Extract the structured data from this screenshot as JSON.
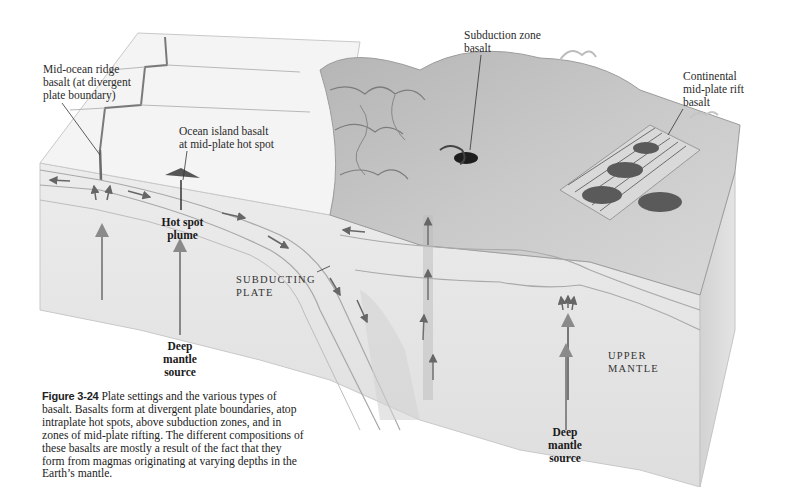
{
  "figure": {
    "number": "Figure 3-24",
    "caption": "Plate settings and the various types of basalt. Basalts form at divergent plate boundaries, atop intraplate hot spots, above subduction zones, and in zones of mid-plate rifting. The different compositions of these basalts are mostly a result of the fact that they form from magmas originating at varying depths in the Earth’s mantle."
  },
  "labels": {
    "mid_ocean_ridge": {
      "line1": "Mid-ocean ridge",
      "line2": "basalt (at divergent",
      "line3": "plate boundary)"
    },
    "ocean_island": {
      "line1": "Ocean island basalt",
      "line2": "at mid-plate hot spot"
    },
    "subduction_zone": {
      "line1": "Subduction zone",
      "line2": "basalt"
    },
    "continental_rift": {
      "line1": "Continental",
      "line2": "mid-plate rift",
      "line3": "basalt"
    },
    "hot_spot_plume": {
      "line1": "Hot spot",
      "line2": "plume"
    },
    "subducting_plate": {
      "line1": "SUBDUCTING",
      "line2": "PLATE"
    },
    "upper_mantle": {
      "line1": "UPPER",
      "line2": "MANTLE"
    },
    "deep_mantle_left": {
      "line1": "Deep",
      "line2": "mantle",
      "line3": "source"
    },
    "deep_mantle_right": {
      "line1": "Deep",
      "line2": "mantle",
      "line3": "source"
    }
  },
  "colors": {
    "ink": "#2a2a2a",
    "block_face": "#e6e6e6",
    "ocean_surface": "#f2f2f2",
    "continent": "#9a9a9a",
    "rift_basalt": "#5a5a5a"
  }
}
